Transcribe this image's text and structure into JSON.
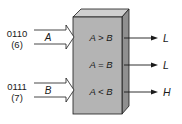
{
  "diagram": {
    "inputs": [
      {
        "name": "A",
        "binary": "0110",
        "decimal": "(6)"
      },
      {
        "name": "B",
        "binary": "0111",
        "decimal": "(7)"
      }
    ],
    "outputs": [
      {
        "condition": "A > B",
        "value": "L"
      },
      {
        "condition": "A = B",
        "value": "L"
      },
      {
        "condition": "A < B",
        "value": "H"
      }
    ],
    "colors": {
      "box_front": "#b4b4b4",
      "box_top": "#cfcfcf",
      "box_side": "#8f8f8f",
      "line": "#1a1a1a"
    }
  }
}
